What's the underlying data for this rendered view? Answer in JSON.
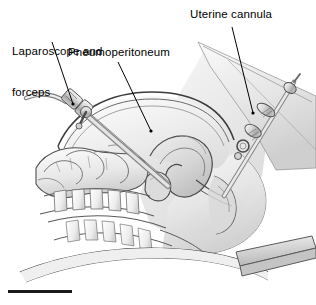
{
  "figure": {
    "background_color": "#ffffff",
    "width": 316,
    "height": 305
  },
  "labels": {
    "laparoscope": {
      "text": "Laparoscope and\nforceps",
      "line1": "Laparoscope and",
      "line2": "forceps"
    },
    "pneumoperitoneum": {
      "text": "Pneumoperitoneum"
    },
    "uterine_cannula": {
      "text": "Uterine cannula"
    }
  },
  "leader_lines": [
    {
      "name": "leader-laparoscope",
      "from": [
        52,
        42
      ],
      "to": [
        73,
        104
      ]
    },
    {
      "name": "leader-pneumoperitoneum",
      "from": [
        118,
        62
      ],
      "to": [
        151,
        131
      ]
    },
    {
      "name": "leader-uterine-cannula",
      "from": [
        232,
        27
      ],
      "to": [
        253,
        113
      ]
    }
  ],
  "anatomy": [
    {
      "name": "abdominal-wall",
      "label": "Abdominal wall"
    },
    {
      "name": "pneumoperitoneum-cavity",
      "label": "Pneumoperitoneum gas cavity"
    },
    {
      "name": "uterus",
      "label": "Uterus"
    },
    {
      "name": "bladder",
      "label": "Bladder"
    },
    {
      "name": "rectum",
      "label": "Rectum"
    },
    {
      "name": "vagina",
      "label": "Vagina"
    },
    {
      "name": "small-bowel-loops",
      "label": "Small bowel loops"
    },
    {
      "name": "spine-vertebrae",
      "label": "Lumbar vertebrae"
    },
    {
      "name": "sacrum",
      "label": "Sacrum"
    },
    {
      "name": "thigh",
      "label": "Thigh"
    },
    {
      "name": "operating-table",
      "label": "Operating table"
    }
  ],
  "instruments": [
    {
      "name": "laparoscope-trocar",
      "label": "Laparoscope and forceps trocar"
    },
    {
      "name": "uterine-cannula-instrument",
      "label": "Uterine cannula"
    }
  ],
  "colors": {
    "ink": "#1a1a1a",
    "line": "#3a3a3a",
    "line_soft": "#6e6e6e",
    "fill_lightest": "#fbfbfb",
    "fill_light": "#f0f0f0",
    "fill_mid": "#e0e0e0",
    "fill_mid2": "#d2d2d2",
    "fill_dark": "#bdbdbd",
    "fill_darker": "#a6a6a6",
    "metal_light": "#ececec",
    "metal_mid": "#c9c9c9",
    "metal_dark": "#9a9a9a",
    "scale_bar": "#1a1a1a"
  }
}
